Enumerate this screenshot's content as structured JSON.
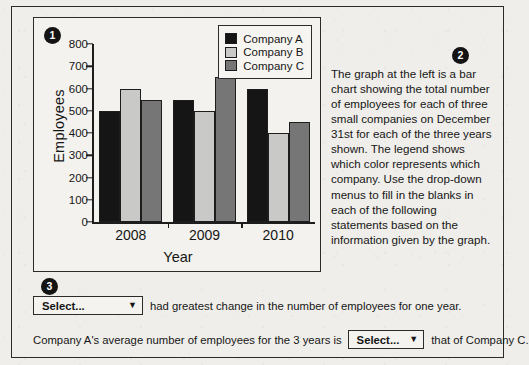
{
  "badges": {
    "one": "1",
    "two": "2",
    "three": "3"
  },
  "chart_data": {
    "type": "bar",
    "title": "",
    "categories": [
      "2008",
      "2009",
      "2010"
    ],
    "series": [
      {
        "name": "Company A",
        "color": "#151515",
        "values": [
          500,
          600,
          600
        ]
      },
      {
        "name": "Company B",
        "color": "#c9c9c7",
        "values": [
          600,
          500,
          400
        ]
      },
      {
        "name": "Company C",
        "color": "#767676",
        "values": [
          550,
          650,
          450
        ]
      }
    ],
    "xlabel": "Year",
    "ylabel": "Employees",
    "ylim": [
      0,
      800
    ],
    "yticks": [
      "800",
      "700",
      "600",
      "500",
      "400",
      "300",
      "200",
      "100",
      "0"
    ],
    "grid": false,
    "legend_position": "top-right"
  },
  "chart_series_fix": [
    {
      "name": "Company A",
      "color": "#151515",
      "values": [
        500,
        550,
        600
      ]
    },
    {
      "name": "Company B",
      "color": "#c9c9c7",
      "values": [
        600,
        500,
        400
      ]
    },
    {
      "name": "Company C",
      "color": "#767676",
      "values": [
        550,
        650,
        450
      ]
    }
  ],
  "description": {
    "text": "The graph at the left is a bar chart showing the total number of employees for each of three small companies on December 31st for each of the three years shown. The legend shows which color represents which company. Use the drop-down menus to fill in the blanks in each of the following statements based on the information given by the graph."
  },
  "questions": [
    {
      "dropdown_value": "Select...",
      "caret": "▼",
      "text_before": "",
      "text_after": "had greatest change in the number of employees for one year."
    },
    {
      "dropdown_value": "Select...",
      "caret": "▼",
      "text_before": "Company A's average number of employees for the 3 years is",
      "text_after": "that of Company C."
    }
  ]
}
